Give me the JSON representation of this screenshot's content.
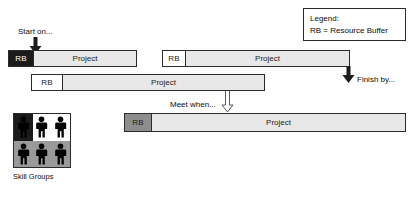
{
  "diagram": {
    "colors": {
      "bar_body": "#e8e8e8",
      "outline": "#2b2b2b",
      "rb_dark": "#1b1b1b",
      "rb_white": "#ffffff",
      "rb_gray": "#8d8d8d",
      "text": "#0d0d0d"
    }
  },
  "legend": {
    "name": "legend",
    "line1": "Legend:",
    "line2": "RB = Resource Buffer"
  },
  "callouts": [
    {
      "id": "start-on",
      "text": "Start on..."
    },
    {
      "id": "finish-by",
      "text": "Finish by..."
    },
    {
      "id": "meet-when",
      "text": "Meet when..."
    }
  ],
  "bars": [
    {
      "id": "project-bar-1",
      "rb_label": "RB",
      "rb_style": "dark",
      "project_label": "Project"
    },
    {
      "id": "project-bar-2",
      "rb_label": "RB",
      "rb_style": "white",
      "project_label": "Project"
    },
    {
      "id": "project-bar-3",
      "rb_label": "RB",
      "rb_style": "white",
      "project_label": "Project"
    },
    {
      "id": "project-bar-4",
      "rb_label": "RB",
      "rb_style": "gray",
      "project_label": "Project"
    }
  ],
  "skill_groups": {
    "caption": "Skill Groups",
    "cells": [
      {
        "shade": "black",
        "figure": "person-icon"
      },
      {
        "shade": "white",
        "figure": "person-icon"
      },
      {
        "shade": "white",
        "figure": "person-icon"
      },
      {
        "shade": "gray",
        "figure": "person-icon"
      },
      {
        "shade": "gray",
        "figure": "person-icon"
      },
      {
        "shade": "gray",
        "figure": "person-icon"
      }
    ]
  }
}
